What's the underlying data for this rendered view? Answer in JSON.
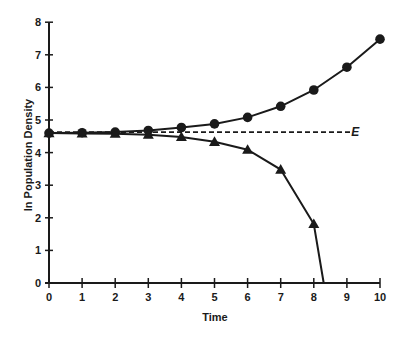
{
  "chart_data": {
    "type": "line",
    "title": "",
    "xlabel": "Time",
    "ylabel": "ln Population Density",
    "xlim": [
      0,
      10
    ],
    "ylim": [
      0,
      8
    ],
    "x_ticks": [
      0,
      1,
      2,
      3,
      4,
      5,
      6,
      7,
      8,
      9,
      10
    ],
    "y_ticks": [
      0,
      1,
      2,
      3,
      4,
      5,
      6,
      7,
      8
    ],
    "grid": false,
    "legend": "none",
    "series": [
      {
        "name": "increasing (circles)",
        "marker": "circle",
        "x": [
          0,
          1,
          2,
          3,
          4,
          5,
          6,
          7,
          8,
          9,
          10
        ],
        "values": [
          4.6,
          4.61,
          4.63,
          4.68,
          4.77,
          4.88,
          5.08,
          5.42,
          5.92,
          6.62,
          7.48
        ]
      },
      {
        "name": "decreasing (triangles)",
        "marker": "triangle",
        "x": [
          0,
          1,
          2,
          3,
          4,
          5,
          6,
          7,
          8
        ],
        "values": [
          4.6,
          4.59,
          4.58,
          4.55,
          4.48,
          4.33,
          4.09,
          3.48,
          1.81
        ],
        "end_point": {
          "x": 8.3,
          "value": 0
        }
      },
      {
        "name": "E",
        "style": "dashed",
        "x": [
          0,
          9.1
        ],
        "values": [
          4.63,
          4.63
        ]
      }
    ],
    "annotations": [
      {
        "text": "E",
        "x": 9.25,
        "value": 4.63
      }
    ]
  },
  "labels": {
    "xlabel": "Time",
    "ylabel": "ln Population Density",
    "e_label": "E"
  },
  "colors": {
    "ink": "#1a1a1a",
    "background": "#ffffff"
  }
}
